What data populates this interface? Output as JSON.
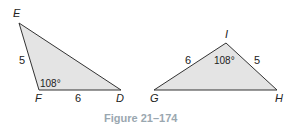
{
  "figure": {
    "caption": "Figure 21–174",
    "caption_color": "#9aa7b0",
    "fill_color": "#e4e4e4",
    "stroke_color": "#333333"
  },
  "triangle_left": {
    "vertices": {
      "E": "E",
      "F": "F",
      "D": "D"
    },
    "side_EF": "5",
    "side_FD": "6",
    "angle_F": "108°"
  },
  "triangle_right": {
    "vertices": {
      "I": "I",
      "G": "G",
      "H": "H"
    },
    "side_GI": "6",
    "side_IH": "5",
    "angle_I": "108°"
  }
}
